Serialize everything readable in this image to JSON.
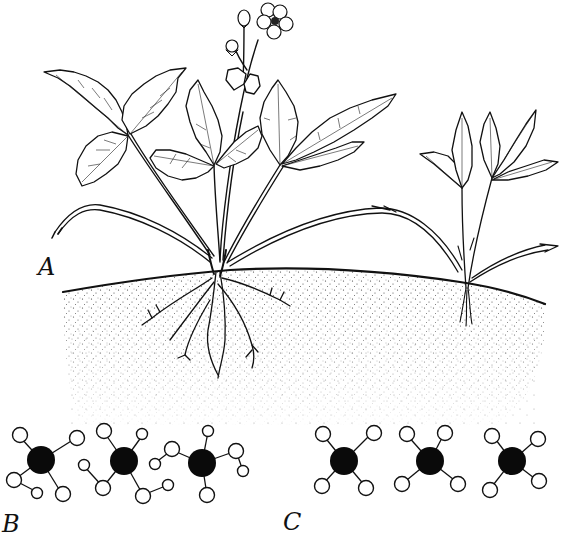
{
  "figure": {
    "labels": {
      "a": "A",
      "b": "B",
      "c": "C"
    },
    "panels": [
      {
        "id": "A",
        "description": "Strawberry plant with runners rooted in soil",
        "components": [
          "mother-plant",
          "flower",
          "flower-bud",
          "trifoliate-leaves",
          "runner-left",
          "runner-right",
          "daughter-plant",
          "soil",
          "root-system"
        ]
      },
      {
        "id": "B",
        "description": "Three irregular molecules with varied bonding",
        "molecule_count": 3
      },
      {
        "id": "C",
        "description": "Three identical symmetric molecules (dark center, four light atoms)",
        "molecule_count": 3
      }
    ],
    "colors": {
      "ink": "#111111",
      "background": "#ffffff",
      "central_atom": "#0a0a0a",
      "outer_atom": "#ffffff"
    }
  }
}
